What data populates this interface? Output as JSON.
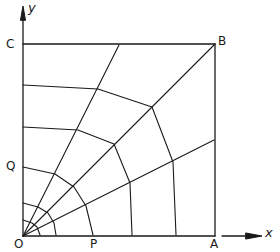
{
  "diagram": {
    "stroke_color": "#1a1a1a",
    "background": "#ffffff",
    "labels": {
      "origin": "O",
      "a": "A",
      "b": "B",
      "c": "C",
      "p": "P",
      "q": "Q",
      "x_axis": "x",
      "y_axis": "y"
    },
    "points": {
      "O": [
        23,
        236
      ],
      "A": [
        215,
        236
      ],
      "B": [
        215,
        44
      ],
      "C": [
        23,
        44
      ]
    },
    "radials": [
      {
        "name": "radial-67deg",
        "to": [
          119,
          45
        ]
      },
      {
        "name": "radial-45deg",
        "to": [
          215,
          44
        ]
      },
      {
        "name": "radial-22deg",
        "to": [
          214,
          140
        ]
      }
    ],
    "rings": [
      {
        "name": "ring-1",
        "points": [
          [
            23,
            220
          ],
          [
            32,
            223
          ],
          [
            37,
            227
          ],
          [
            40,
            235
          ]
        ]
      },
      {
        "name": "ring-2",
        "points": [
          [
            23,
            203
          ],
          [
            38,
            207
          ],
          [
            48,
            213
          ],
          [
            54,
            223
          ],
          [
            56,
            235
          ]
        ]
      },
      {
        "name": "ring-3",
        "points": [
          [
            23,
            167
          ],
          [
            55,
            174
          ],
          [
            74,
            187
          ],
          [
            86,
            206
          ],
          [
            93,
            235
          ]
        ]
      },
      {
        "name": "ring-4",
        "points": [
          [
            23,
            127
          ],
          [
            78,
            130
          ],
          [
            114,
            144
          ],
          [
            130,
            183
          ],
          [
            132,
            235
          ]
        ]
      },
      {
        "name": "ring-5",
        "points": [
          [
            23,
            85
          ],
          [
            98,
            89
          ],
          [
            152,
            107
          ],
          [
            173,
            162
          ],
          [
            176,
            235
          ]
        ]
      }
    ]
  }
}
